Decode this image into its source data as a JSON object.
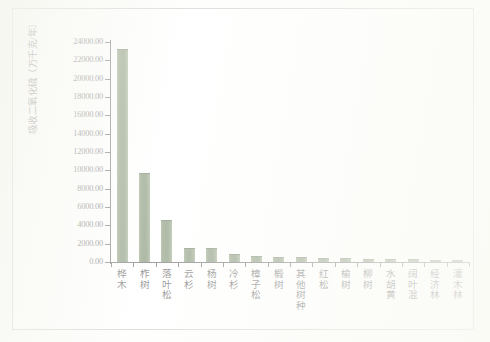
{
  "chart_data": {
    "type": "bar",
    "title": "",
    "xlabel": "",
    "ylabel": "吸收二氧化硫（万千克/年）",
    "ylim": [
      0,
      24000
    ],
    "ytick_step": 2000,
    "ytick_labels": [
      "24000.00",
      "22000.00",
      "20000.00",
      "18000.00",
      "16000.00",
      "14000.00",
      "12000.00",
      "10000.00",
      "8000.00",
      "6000.00",
      "4000.00",
      "2000.00",
      "0.00"
    ],
    "grid": false,
    "legend": "none",
    "bar_color": "#4e6b3e",
    "categories": [
      "桦木",
      "柞树",
      "落叶松",
      "云杉",
      "杨树",
      "冷杉",
      "樟子松",
      "椴树",
      "其他树种",
      "红松",
      "榆树",
      "柳树",
      "水胡黄",
      "阔叶混",
      "经济林",
      "灌木林"
    ],
    "values": [
      23200.0,
      9750.0,
      4600.0,
      1550.0,
      1500.0,
      900.0,
      620.0,
      560.0,
      500.0,
      420.0,
      400.0,
      380.0,
      340.0,
      300.0,
      200.0,
      170.0
    ],
    "series": [
      {
        "name": "吸收二氧化硫",
        "values": [
          23200.0,
          9750.0,
          4600.0,
          1550.0,
          1500.0,
          900.0,
          620.0,
          560.0,
          500.0,
          420.0,
          400.0,
          380.0,
          340.0,
          300.0,
          200.0,
          170.0
        ]
      }
    ]
  }
}
